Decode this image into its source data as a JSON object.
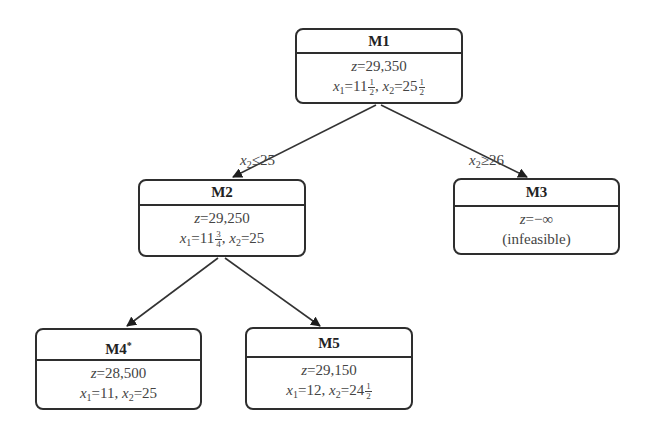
{
  "diagram": {
    "type": "branch-and-bound-tree",
    "nodes": [
      {
        "id": "M1",
        "title": "M",
        "title_num": "1",
        "marker": "",
        "z": "29,350",
        "x1": {
          "whole": "11",
          "num": "1",
          "den": "2"
        },
        "x2": {
          "whole": "25",
          "num": "1",
          "den": "2"
        }
      },
      {
        "id": "M2",
        "title": "M",
        "title_num": "2",
        "marker": "",
        "z": "29,250",
        "x1": {
          "whole": "11",
          "num": "3",
          "den": "4"
        },
        "x2": {
          "whole": "25",
          "num": "",
          "den": ""
        }
      },
      {
        "id": "M3",
        "title": "M",
        "title_num": "3",
        "marker": "",
        "z": "−∞",
        "note": "(infeasible)"
      },
      {
        "id": "M4",
        "title": "M",
        "title_num": "4",
        "marker": "*",
        "z": "28,500",
        "x1": {
          "whole": "11",
          "num": "",
          "den": ""
        },
        "x2": {
          "whole": "25",
          "num": "",
          "den": ""
        }
      },
      {
        "id": "M5",
        "title": "M",
        "title_num": "5",
        "marker": "",
        "z": "29,150",
        "x1": {
          "whole": "12",
          "num": "",
          "den": ""
        },
        "x2": {
          "whole": "24",
          "num": "1",
          "den": "2"
        }
      }
    ],
    "edges": [
      {
        "from": "M1",
        "to": "M2",
        "var": "x",
        "sub": "2",
        "op": "≤",
        "val": "25"
      },
      {
        "from": "M1",
        "to": "M3",
        "var": "x",
        "sub": "2",
        "op": "≥",
        "val": "26"
      },
      {
        "from": "M2",
        "to": "M4",
        "var": "x",
        "sub": "1",
        "op": "≤",
        "val": "11"
      },
      {
        "from": "M2",
        "to": "M5",
        "var": "x",
        "sub": "1",
        "op": "≥",
        "val": "12"
      }
    ],
    "labels": {
      "z": "z",
      "eq": "=",
      "x": "x",
      "sub1": "1",
      "sub2": "2",
      "sep": ", "
    }
  }
}
